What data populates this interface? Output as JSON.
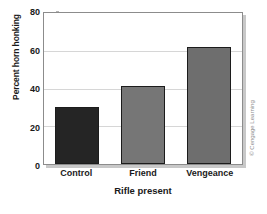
{
  "chart_data": {
    "type": "bar",
    "title": "",
    "categories": [
      "Control",
      "Friend",
      "Vengeance"
    ],
    "values": [
      30,
      41.5,
      62
    ],
    "series": [
      {
        "name": "Percent horn honking",
        "values": [
          30,
          41.5,
          62
        ],
        "colors": [
          "#252525",
          "#767676",
          "#6e6e6e"
        ]
      }
    ],
    "xlabel": "Rifle present",
    "ylabel": "Percent horn honking",
    "ylim": [
      0,
      80
    ],
    "yticks": [
      0,
      20,
      40,
      60,
      80
    ],
    "ytick_labels": [
      "0",
      "20",
      "40",
      "60",
      "80"
    ],
    "grid": true,
    "legend": "none"
  },
  "credit": {
    "text": "© Cengage Learning"
  },
  "colors": {
    "bar_control": "#252525",
    "bar_friend": "#767676",
    "bar_vengeance": "#6e6e6e",
    "gridline": "#d6d6d6",
    "frame": "#8c8c8c",
    "text": "#1a1a1a"
  }
}
